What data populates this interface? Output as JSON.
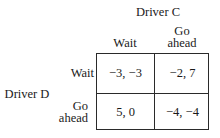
{
  "column_player": {
    "label": "Driver C",
    "strategies": [
      "Wait",
      "Go ahead"
    ],
    "strategy_lines": [
      [
        "Wait"
      ],
      [
        "Go",
        "ahead"
      ]
    ]
  },
  "row_player": {
    "label": "Driver D",
    "strategies": [
      "Wait",
      "Go ahead"
    ],
    "strategy_lines": [
      [
        "Wait"
      ],
      [
        "Go",
        "ahead"
      ]
    ]
  },
  "payoffs": [
    [
      "−3, −3",
      "−2, 7"
    ],
    [
      "5, 0",
      "−4, −4"
    ]
  ]
}
